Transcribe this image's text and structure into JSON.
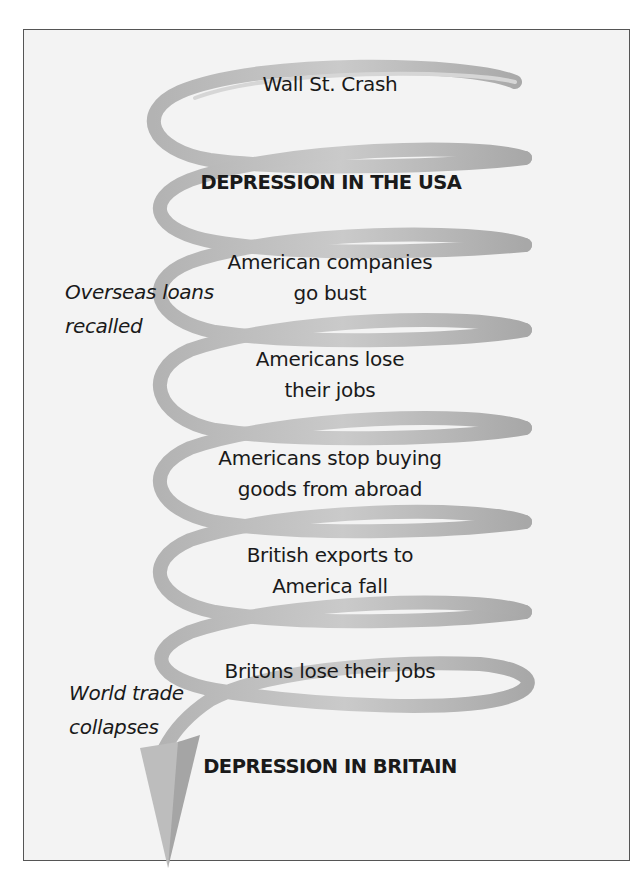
{
  "diagram": {
    "type": "spiral-flow",
    "colors": {
      "frame_border": "#555555",
      "frame_background": "#f3f3f3",
      "spiral_light": "#c4c4c4",
      "spiral_dark": "#a9a9a9",
      "text": "#1a1a1a"
    },
    "steps": [
      {
        "lines": [
          "Wall St. Crash"
        ]
      },
      {
        "lines": [
          "DEPRESSION IN THE USA"
        ],
        "emphasis": true
      },
      {
        "lines": [
          "American companies",
          "go bust"
        ]
      },
      {
        "lines": [
          "Americans lose",
          "their jobs"
        ]
      },
      {
        "lines": [
          "Americans stop buying",
          "goods from abroad"
        ]
      },
      {
        "lines": [
          "British exports to",
          "America fall"
        ]
      },
      {
        "lines": [
          "Britons lose their jobs"
        ]
      },
      {
        "lines": [
          "DEPRESSION IN BRITAIN"
        ],
        "emphasis": true
      }
    ],
    "side_notes": [
      {
        "lines": [
          "Overseas loans",
          "recalled"
        ]
      },
      {
        "lines": [
          "World trade",
          "collapses"
        ]
      }
    ]
  }
}
